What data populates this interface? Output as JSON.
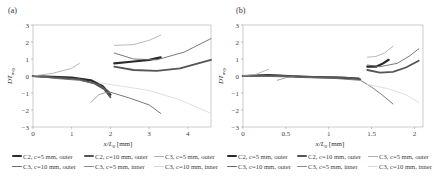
{
  "chart_data": [
    {
      "type": "line",
      "panel": "(a)",
      "title": "",
      "xlabel": "x/L_0 [mm]",
      "ylabel": "DT_avg",
      "xlim": [
        0,
        4.6
      ],
      "ylim": [
        -3,
        3
      ],
      "xticks": [
        0,
        1,
        2,
        3,
        4
      ],
      "yticks": [
        -3,
        -2,
        -1,
        0,
        1,
        2,
        3
      ],
      "grid": false,
      "series": [
        {
          "name": "C2, c=5 mm, outer",
          "segments": [
            [
              [
                0,
                0
              ],
              [
                0.5,
                -0.05
              ],
              [
                1.0,
                -0.1
              ],
              [
                1.5,
                -0.25
              ],
              [
                1.8,
                -0.6
              ],
              [
                2.0,
                -1.1
              ]
            ],
            [
              [
                2.1,
                0.75
              ],
              [
                2.6,
                0.85
              ],
              [
                3.0,
                0.95
              ],
              [
                3.3,
                1.1
              ]
            ]
          ]
        },
        {
          "name": "C2, c=10 mm, outer",
          "segments": [
            [
              [
                0,
                0
              ],
              [
                0.6,
                -0.1
              ],
              [
                1.2,
                -0.2
              ],
              [
                1.6,
                -0.45
              ],
              [
                1.85,
                -0.8
              ],
              [
                2.0,
                -1.25
              ]
            ],
            [
              [
                2.1,
                0.55
              ],
              [
                2.6,
                0.35
              ],
              [
                3.2,
                0.3
              ],
              [
                3.8,
                0.45
              ],
              [
                4.6,
                0.95
              ]
            ]
          ]
        },
        {
          "name": "C3, c=5 mm, outer",
          "segments": [
            [
              [
                0,
                0
              ],
              [
                0.5,
                0.15
              ],
              [
                1.0,
                0.45
              ],
              [
                1.2,
                0.75
              ]
            ],
            [
              [
                2.1,
                1.8
              ],
              [
                2.6,
                1.85
              ],
              [
                3.0,
                2.1
              ],
              [
                3.3,
                2.4
              ]
            ]
          ]
        },
        {
          "name": "C3, c=10 mm, outer",
          "segments": [
            [
              [
                0,
                0
              ],
              [
                0.6,
                -0.15
              ],
              [
                1.2,
                -0.25
              ],
              [
                1.7,
                -0.5
              ],
              [
                2.0,
                -0.95
              ],
              [
                2.5,
                -1.3
              ],
              [
                3.0,
                -1.7
              ],
              [
                3.3,
                -2.2
              ]
            ],
            [
              [
                2.1,
                1.35
              ],
              [
                2.6,
                1.0
              ],
              [
                3.2,
                0.95
              ],
              [
                3.9,
                1.4
              ],
              [
                4.6,
                2.2
              ]
            ]
          ]
        },
        {
          "name": "C3, c=5 mm, inner",
          "segments": [
            [
              [
                1.5,
                -1.55
              ],
              [
                1.7,
                -1.1
              ],
              [
                1.9,
                -0.95
              ],
              [
                2.0,
                -1.0
              ]
            ]
          ]
        },
        {
          "name": "C3, c=10 mm, inner",
          "segments": [
            [
              [
                1.7,
                -0.4
              ],
              [
                2.3,
                -0.6
              ],
              [
                3.0,
                -0.85
              ],
              [
                3.8,
                -1.4
              ],
              [
                4.6,
                -2.2
              ]
            ]
          ]
        }
      ]
    },
    {
      "type": "line",
      "panel": "(b)",
      "title": "",
      "xlabel": "x/L_0 [mm]",
      "ylabel": "DT_avg",
      "xlim": [
        0,
        2.1
      ],
      "ylim": [
        -3,
        3
      ],
      "xticks": [
        0,
        0.5,
        1,
        1.5,
        2
      ],
      "yticks": [
        -3,
        -2,
        -1,
        0,
        1,
        2,
        3
      ],
      "grid": false,
      "series": [
        {
          "name": "C2, c=5 mm, outer",
          "segments": [
            [
              [
                0,
                0
              ],
              [
                0.3,
                0.05
              ],
              [
                0.7,
                -0.05
              ],
              [
                1.1,
                -0.1
              ],
              [
                1.35,
                -0.15
              ]
            ],
            [
              [
                1.45,
                0.55
              ],
              [
                1.55,
                0.55
              ],
              [
                1.62,
                0.7
              ],
              [
                1.7,
                0.95
              ]
            ]
          ]
        },
        {
          "name": "C2, c=10 mm, outer",
          "segments": [
            [
              [
                0,
                0
              ],
              [
                0.4,
                0.02
              ],
              [
                0.8,
                -0.05
              ],
              [
                1.2,
                -0.1
              ],
              [
                1.37,
                -0.2
              ]
            ],
            [
              [
                1.45,
                0.35
              ],
              [
                1.6,
                0.2
              ],
              [
                1.75,
                0.25
              ],
              [
                1.9,
                0.5
              ],
              [
                2.05,
                0.9
              ]
            ]
          ]
        },
        {
          "name": "C3, c=5 mm, outer",
          "segments": [
            [
              [
                0,
                0
              ],
              [
                0.15,
                0.1
              ],
              [
                0.3,
                0.4
              ]
            ],
            [
              [
                1.45,
                1.1
              ],
              [
                1.55,
                1.15
              ],
              [
                1.65,
                1.35
              ],
              [
                1.75,
                1.75
              ]
            ]
          ]
        },
        {
          "name": "C3, c=10 mm, outer",
          "segments": [
            [
              [
                0,
                0
              ],
              [
                0.5,
                -0.05
              ],
              [
                1.0,
                -0.12
              ],
              [
                1.37,
                -0.25
              ],
              [
                1.5,
                -0.65
              ],
              [
                1.62,
                -1.1
              ],
              [
                1.75,
                -1.65
              ]
            ],
            [
              [
                1.45,
                0.65
              ],
              [
                1.6,
                0.55
              ],
              [
                1.8,
                0.75
              ],
              [
                1.95,
                1.2
              ],
              [
                2.05,
                1.6
              ]
            ]
          ]
        },
        {
          "name": "C3, c=5 mm, inner",
          "segments": [
            [
              [
                0.4,
                -0.25
              ],
              [
                0.5,
                -0.1
              ],
              [
                0.6,
                -0.05
              ]
            ]
          ]
        },
        {
          "name": "C3, c=10 mm, inner",
          "segments": [
            [
              [
                1.45,
                -0.5
              ],
              [
                1.7,
                -0.75
              ],
              [
                1.9,
                -1.1
              ],
              [
                2.05,
                -1.55
              ]
            ]
          ]
        }
      ]
    }
  ],
  "panels": {
    "a": {
      "label": "(a)"
    },
    "b": {
      "label": "(b)"
    }
  },
  "axis": {
    "xlabel_var": "x/L",
    "xlabel_sub": "0",
    "xlabel_unit": " [mm]",
    "ylabel_var": "DT",
    "ylabel_sub": "avg"
  },
  "legend": {
    "items": [
      {
        "label": "C2, c=5 mm, outer",
        "color": "#2b2b2b",
        "width": 2.2
      },
      {
        "label": "C2, c=10 mm, outer",
        "color": "#555555",
        "width": 1.8
      },
      {
        "label": "C3, c=5 mm, outer",
        "color": "#b0b0b0",
        "width": 0.9
      },
      {
        "label": "C3, c=10 mm, outer",
        "color": "#6a6a6a",
        "width": 0.9
      },
      {
        "label": "C3, c=5 mm, inner",
        "color": "#8a8a8a",
        "width": 0.8
      },
      {
        "label": "C3, c=10 mm, inner",
        "color": "#d8d8d8",
        "width": 0.8
      }
    ],
    "rows": [
      [
        0,
        1,
        2,
        0,
        1,
        2
      ],
      [
        3,
        4,
        5,
        3,
        4,
        5
      ]
    ]
  }
}
